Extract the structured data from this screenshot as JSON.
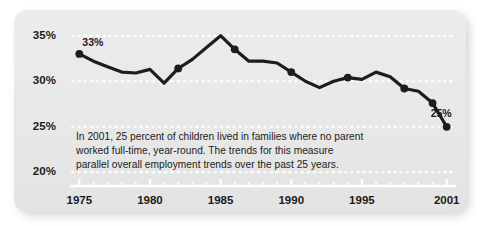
{
  "chart_data": {
    "type": "line",
    "title": "",
    "xlabel": "",
    "ylabel": "",
    "x": [
      1975,
      1976,
      1977,
      1978,
      1979,
      1980,
      1981,
      1982,
      1983,
      1984,
      1985,
      1986,
      1987,
      1988,
      1989,
      1990,
      1991,
      1992,
      1993,
      1994,
      1995,
      1996,
      1997,
      1998,
      1999,
      2000,
      2001
    ],
    "values": [
      33.0,
      32.2,
      31.6,
      31.0,
      30.9,
      31.3,
      29.8,
      31.4,
      32.4,
      33.7,
      35.0,
      33.5,
      32.2,
      32.2,
      32.0,
      31.0,
      30.0,
      29.3,
      30.0,
      30.4,
      30.2,
      31.0,
      30.5,
      29.2,
      28.9,
      27.6,
      25.0
    ],
    "grid": true,
    "gridlines": [
      35,
      30,
      25,
      20
    ],
    "ylim": [
      18.5,
      36.5
    ],
    "xlim": [
      1974.2,
      2001.8
    ],
    "ytick_labels": [
      "35%",
      "30%",
      "25%",
      "20%"
    ],
    "ytick_values": [
      35,
      30,
      25,
      20
    ],
    "xtick_labels": [
      "1975",
      "1980",
      "1985",
      "1990",
      "1995",
      "2001"
    ],
    "xtick_values": [
      1975,
      1980,
      1985,
      1990,
      1995,
      2001
    ],
    "minor_xticks_every": 1,
    "legend": null,
    "annotations": [
      {
        "name": "first-point",
        "x": 1975,
        "y": 33.0,
        "label": "33%",
        "marker": true
      },
      {
        "name": "point-1982",
        "x": 1982,
        "y": 31.4,
        "label": "",
        "marker": true
      },
      {
        "name": "point-1986",
        "x": 1986,
        "y": 33.5,
        "label": "",
        "marker": true
      },
      {
        "name": "point-1990",
        "x": 1990,
        "y": 31.0,
        "label": "",
        "marker": true
      },
      {
        "name": "point-1994",
        "x": 1994,
        "y": 30.4,
        "label": "",
        "marker": true
      },
      {
        "name": "point-1998",
        "x": 1998,
        "y": 29.2,
        "label": "",
        "marker": true
      },
      {
        "name": "point-2000",
        "x": 2000,
        "y": 27.6,
        "label": "",
        "marker": true
      },
      {
        "name": "last-point",
        "x": 2001,
        "y": 25.0,
        "label": "25%",
        "marker": true
      }
    ],
    "line_color": "#1d1d1d",
    "grid_color": "#ffffff",
    "axis_color": "#ffffff",
    "panel_color": "#e9e9e9",
    "text_color": "#1b1b1b"
  },
  "labels": {
    "y": [
      {
        "text": "35%",
        "value": 35
      },
      {
        "text": "30%",
        "value": 30
      },
      {
        "text": "25%",
        "value": 25
      },
      {
        "text": "20%",
        "value": 20
      }
    ],
    "x": [
      {
        "text": "1975",
        "value": 1975
      },
      {
        "text": "1980",
        "value": 1980
      },
      {
        "text": "1985",
        "value": 1985
      },
      {
        "text": "1990",
        "value": 1990
      },
      {
        "text": "1995",
        "value": 1995
      },
      {
        "text": "2001",
        "value": 2001
      }
    ],
    "point_first": "33%",
    "point_last": "25%"
  },
  "annotation": {
    "text": "In 2001, 25 percent of children lived in families where no parent worked full-time, year-round. The trends for this measure parallel overall employment trends over the past 25 years."
  }
}
